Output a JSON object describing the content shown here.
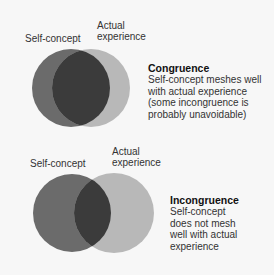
{
  "colors": {
    "background": "#f7f7f7",
    "self_concept_circle": "#6b6b6b",
    "actual_experience_circle": "#b8b8b8",
    "overlap": "#3b3b3b"
  },
  "diagrams": [
    {
      "label_left": "Self-concept",
      "label_right_line1": "Actual",
      "label_right_line2": "experience",
      "title": "Congruence",
      "desc_lines": [
        "Self-concept meshes well",
        "with actual experience",
        "(some incongruence is",
        "probably unavoidable)"
      ]
    },
    {
      "label_left": "Self-concept",
      "label_right_line1": "Actual",
      "label_right_line2": "experience",
      "title": "Incongruence",
      "desc_lines": [
        "Self-concept",
        "does not mesh",
        "well with actual",
        "experience"
      ]
    }
  ]
}
